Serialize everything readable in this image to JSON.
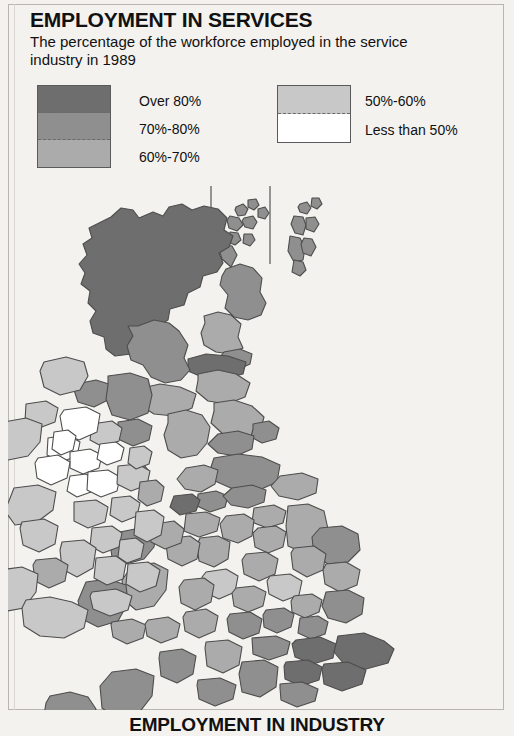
{
  "header": {
    "title": "EMPLOYMENT IN SERVICES",
    "subtitle": "The percentage of the workforce employed in the service industry in 1989"
  },
  "legend": {
    "left_column": [
      {
        "label": "Over 80%",
        "color": "#6e6e6e"
      },
      {
        "label": "70%-80%",
        "color": "#8f8f8f"
      },
      {
        "label": "60%-70%",
        "color": "#ababab"
      }
    ],
    "right_column": [
      {
        "label": "50%-60%",
        "color": "#c8c8c8"
      },
      {
        "label": "Less than 50%",
        "color": "#ffffff"
      }
    ]
  },
  "map": {
    "name": "united-kingdom-and-ireland-choropleth",
    "sea_color": "#f4f2ef",
    "border_color": "#4d4d4d",
    "insets": [
      {
        "name": "orkney-islands",
        "shade": "#8f8f8f"
      },
      {
        "name": "shetland-islands",
        "shade": "#8f8f8f"
      }
    ],
    "regions": [
      {
        "name": "scottish-highlands",
        "shade": "#6e6e6e",
        "band": "Over 80%"
      },
      {
        "name": "grampian",
        "shade": "#8f8f8f",
        "band": "70%-80%"
      },
      {
        "name": "tayside",
        "shade": "#ababab",
        "band": "60%-70%"
      },
      {
        "name": "fife",
        "shade": "#8f8f8f",
        "band": "70%-80%"
      },
      {
        "name": "lothian-edinburgh",
        "shade": "#6e6e6e",
        "band": "Over 80%"
      },
      {
        "name": "strathclyde",
        "shade": "#8f8f8f",
        "band": "70%-80%"
      },
      {
        "name": "dumfries-galloway",
        "shade": "#ababab",
        "band": "60%-70%"
      },
      {
        "name": "borders",
        "shade": "#ababab",
        "band": "60%-70%"
      },
      {
        "name": "northumberland",
        "shade": "#ababab",
        "band": "60%-70%"
      },
      {
        "name": "tyne-and-wear",
        "shade": "#8f8f8f",
        "band": "70%-80%"
      },
      {
        "name": "cumbria",
        "shade": "#ababab",
        "band": "60%-70%"
      },
      {
        "name": "durham",
        "shade": "#8f8f8f",
        "band": "70%-80%"
      },
      {
        "name": "north-yorkshire",
        "shade": "#8f8f8f",
        "band": "70%-80%"
      },
      {
        "name": "humberside",
        "shade": "#ababab",
        "band": "60%-70%"
      },
      {
        "name": "lancashire",
        "shade": "#ababab",
        "band": "60%-70%"
      },
      {
        "name": "greater-manchester",
        "shade": "#8f8f8f",
        "band": "70%-80%"
      },
      {
        "name": "merseyside",
        "shade": "#6e6e6e",
        "band": "Over 80%"
      },
      {
        "name": "west-yorkshire",
        "shade": "#8f8f8f",
        "band": "70%-80%"
      },
      {
        "name": "south-yorkshire",
        "shade": "#ababab",
        "band": "60%-70%"
      },
      {
        "name": "derbyshire",
        "shade": "#ababab",
        "band": "60%-70%"
      },
      {
        "name": "nottinghamshire",
        "shade": "#ababab",
        "band": "60%-70%"
      },
      {
        "name": "lincolnshire",
        "shade": "#ababab",
        "band": "60%-70%"
      },
      {
        "name": "cheshire",
        "shade": "#ababab",
        "band": "60%-70%"
      },
      {
        "name": "staffordshire",
        "shade": "#ababab",
        "band": "60%-70%"
      },
      {
        "name": "shropshire",
        "shade": "#ababab",
        "band": "60%-70%"
      },
      {
        "name": "west-midlands",
        "shade": "#c8c8c8",
        "band": "50%-60%"
      },
      {
        "name": "leicestershire",
        "shade": "#ababab",
        "band": "60%-70%"
      },
      {
        "name": "norfolk",
        "shade": "#8f8f8f",
        "band": "70%-80%"
      },
      {
        "name": "suffolk",
        "shade": "#ababab",
        "band": "60%-70%"
      },
      {
        "name": "cambridgeshire",
        "shade": "#ababab",
        "band": "60%-70%"
      },
      {
        "name": "northamptonshire",
        "shade": "#c8c8c8",
        "band": "50%-60%"
      },
      {
        "name": "warwickshire",
        "shade": "#ababab",
        "band": "60%-70%"
      },
      {
        "name": "hereford-worcester",
        "shade": "#ababab",
        "band": "60%-70%"
      },
      {
        "name": "gwynedd",
        "shade": "#8f8f8f",
        "band": "70%-80%"
      },
      {
        "name": "clwyd",
        "shade": "#ababab",
        "band": "60%-70%"
      },
      {
        "name": "powys",
        "shade": "#ababab",
        "band": "60%-70%"
      },
      {
        "name": "dyfed",
        "shade": "#8f8f8f",
        "band": "70%-80%"
      },
      {
        "name": "west-glamorgan",
        "shade": "#ababab",
        "band": "60%-70%"
      },
      {
        "name": "gwent",
        "shade": "#ababab",
        "band": "60%-70%"
      },
      {
        "name": "gloucestershire",
        "shade": "#ababab",
        "band": "60%-70%"
      },
      {
        "name": "oxfordshire",
        "shade": "#8f8f8f",
        "band": "70%-80%"
      },
      {
        "name": "buckinghamshire",
        "shade": "#8f8f8f",
        "band": "70%-80%"
      },
      {
        "name": "bedfordshire",
        "shade": "#ababab",
        "band": "60%-70%"
      },
      {
        "name": "hertfordshire",
        "shade": "#8f8f8f",
        "band": "70%-80%"
      },
      {
        "name": "essex",
        "shade": "#8f8f8f",
        "band": "70%-80%"
      },
      {
        "name": "greater-london",
        "shade": "#6e6e6e",
        "band": "Over 80%"
      },
      {
        "name": "kent",
        "shade": "#6e6e6e",
        "band": "Over 80%"
      },
      {
        "name": "surrey",
        "shade": "#6e6e6e",
        "band": "Over 80%"
      },
      {
        "name": "east-sussex",
        "shade": "#6e6e6e",
        "band": "Over 80%"
      },
      {
        "name": "west-sussex",
        "shade": "#8f8f8f",
        "band": "70%-80%"
      },
      {
        "name": "hampshire",
        "shade": "#8f8f8f",
        "band": "70%-80%"
      },
      {
        "name": "berkshire",
        "shade": "#8f8f8f",
        "band": "70%-80%"
      },
      {
        "name": "wiltshire",
        "shade": "#ababab",
        "band": "60%-70%"
      },
      {
        "name": "dorset",
        "shade": "#8f8f8f",
        "band": "70%-80%"
      },
      {
        "name": "somerset",
        "shade": "#8f8f8f",
        "band": "70%-80%"
      },
      {
        "name": "devon",
        "shade": "#8f8f8f",
        "band": "70%-80%"
      },
      {
        "name": "cornwall",
        "shade": "#8f8f8f",
        "band": "70%-80%"
      },
      {
        "name": "isle-of-man",
        "shade": "#8f8f8f",
        "band": "70%-80%"
      },
      {
        "name": "antrim-belfast",
        "shade": "#8f8f8f",
        "band": "70%-80%"
      },
      {
        "name": "londonderry",
        "shade": "#8f8f8f",
        "band": "70%-80%"
      },
      {
        "name": "down",
        "shade": "#8f8f8f",
        "band": "70%-80%"
      },
      {
        "name": "armagh",
        "shade": "#c8c8c8",
        "band": "50%-60%"
      },
      {
        "name": "tyrone",
        "shade": "#ffffff",
        "band": "Less than 50%"
      },
      {
        "name": "fermanagh",
        "shade": "#ffffff",
        "band": "Less than 50%"
      },
      {
        "name": "donegal",
        "shade": "#c8c8c8",
        "band": "50%-60%"
      },
      {
        "name": "sligo",
        "shade": "#c8c8c8",
        "band": "50%-60%"
      },
      {
        "name": "mayo",
        "shade": "#c8c8c8",
        "band": "50%-60%"
      },
      {
        "name": "leitrim",
        "shade": "#ffffff",
        "band": "Less than 50%"
      },
      {
        "name": "cavan",
        "shade": "#ffffff",
        "band": "Less than 50%"
      },
      {
        "name": "monaghan",
        "shade": "#ffffff",
        "band": "Less than 50%"
      },
      {
        "name": "roscommon",
        "shade": "#ffffff",
        "band": "Less than 50%"
      },
      {
        "name": "longford",
        "shade": "#ffffff",
        "band": "Less than 50%"
      },
      {
        "name": "westmeath",
        "shade": "#ffffff",
        "band": "Less than 50%"
      },
      {
        "name": "meath",
        "shade": "#c8c8c8",
        "band": "50%-60%"
      },
      {
        "name": "louth",
        "shade": "#c8c8c8",
        "band": "50%-60%"
      },
      {
        "name": "galway",
        "shade": "#c8c8c8",
        "band": "50%-60%"
      },
      {
        "name": "offaly",
        "shade": "#c8c8c8",
        "band": "50%-60%"
      },
      {
        "name": "kildare",
        "shade": "#c8c8c8",
        "band": "50%-60%"
      },
      {
        "name": "dublin",
        "shade": "#ababab",
        "band": "60%-70%"
      },
      {
        "name": "wicklow",
        "shade": "#c8c8c8",
        "band": "50%-60%"
      },
      {
        "name": "laois",
        "shade": "#c8c8c8",
        "band": "50%-60%"
      },
      {
        "name": "carlow",
        "shade": "#c8c8c8",
        "band": "50%-60%"
      },
      {
        "name": "wexford",
        "shade": "#c8c8c8",
        "band": "50%-60%"
      },
      {
        "name": "kilkenny",
        "shade": "#c8c8c8",
        "band": "50%-60%"
      },
      {
        "name": "tipperary",
        "shade": "#c8c8c8",
        "band": "50%-60%"
      },
      {
        "name": "waterford",
        "shade": "#c8c8c8",
        "band": "50%-60%"
      },
      {
        "name": "clare",
        "shade": "#c8c8c8",
        "band": "50%-60%"
      },
      {
        "name": "limerick",
        "shade": "#ababab",
        "band": "60%-70%"
      },
      {
        "name": "kerry",
        "shade": "#c8c8c8",
        "band": "50%-60%"
      },
      {
        "name": "cork",
        "shade": "#c8c8c8",
        "band": "50%-60%"
      }
    ]
  },
  "footer": {
    "next_section_title": "EMPLOYMENT IN INDUSTRY"
  }
}
